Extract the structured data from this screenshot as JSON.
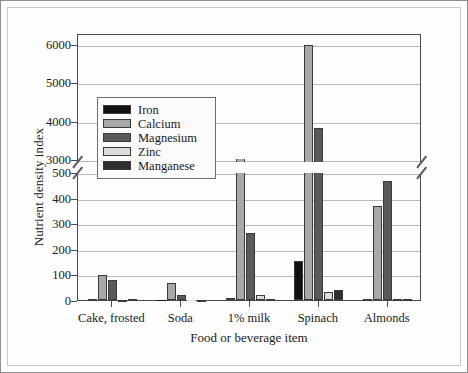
{
  "figure": {
    "y_axis_title": "Nutrient density index",
    "x_axis_title": "Food or beverage item"
  },
  "legend": {
    "items": [
      {
        "label": "Iron",
        "color": "#111111"
      },
      {
        "label": "Calcium",
        "color": "#a8a8a8"
      },
      {
        "label": "Magnesium",
        "color": "#5a5a5a"
      },
      {
        "label": "Zinc",
        "color": "#dcdcdc"
      },
      {
        "label": "Manganese",
        "color": "#2e2e2e"
      }
    ]
  },
  "y_ticks_lower": [
    "0",
    "100",
    "200",
    "300",
    "400",
    "500"
  ],
  "y_ticks_upper": [
    "3000",
    "4000",
    "5000",
    "6000"
  ],
  "chart_data": {
    "type": "bar",
    "title": "",
    "xlabel": "Food or beverage item",
    "ylabel": "Nutrient density index",
    "grid": true,
    "legend_position": "inside-upper-left",
    "axis_break": {
      "lower_range": [
        0,
        500
      ],
      "upper_range": [
        3000,
        6000
      ],
      "lower_tick_step": 100,
      "upper_tick_step": 1000
    },
    "ylim": [
      0,
      6000
    ],
    "categories": [
      "Cake, frosted",
      "Soda",
      "1% milk",
      "Spinach",
      "Almonds"
    ],
    "series": [
      {
        "name": "Iron",
        "color": "#111111",
        "values": [
          5,
          0,
          8,
          152,
          4
        ]
      },
      {
        "name": "Calcium",
        "color": "#a8a8a8",
        "values": [
          97,
          67,
          1200,
          5980,
          368
        ]
      },
      {
        "name": "Magnesium",
        "color": "#5a5a5a",
        "values": [
          80,
          20,
          260,
          3820,
          465
        ]
      },
      {
        "name": "Zinc",
        "color": "#dcdcdc",
        "values": [
          1,
          0,
          20,
          30,
          4
        ]
      },
      {
        "name": "Manganese",
        "color": "#2e2e2e",
        "values": [
          2,
          1,
          2,
          40,
          4
        ]
      }
    ]
  }
}
